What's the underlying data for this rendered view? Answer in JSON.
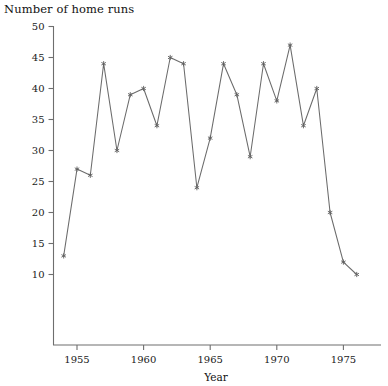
{
  "chart_data": {
    "type": "line",
    "title": "Number of home runs",
    "xlabel": "Year",
    "ylabel": "",
    "xlim": [
      1953.2,
      1976.8
    ],
    "ylim": [
      6.5,
      50
    ],
    "grid": false,
    "legend": "none",
    "marker": "asterisk",
    "line_color": "#6b6b6b",
    "marker_color": "#5f5f5f",
    "xticks": [
      1955,
      1960,
      1965,
      1970,
      1975
    ],
    "xtick_labels": [
      "1955",
      "1960",
      "1965",
      "1970",
      "1975"
    ],
    "yticks": [
      10,
      15,
      20,
      25,
      30,
      35,
      40,
      45,
      50
    ],
    "ytick_labels": [
      "10",
      "15",
      "20",
      "25",
      "30",
      "35",
      "40",
      "45",
      "50"
    ],
    "x": [
      1954,
      1955,
      1956,
      1957,
      1958,
      1959,
      1960,
      1961,
      1962,
      1963,
      1964,
      1965,
      1966,
      1967,
      1968,
      1969,
      1970,
      1971,
      1972,
      1973,
      1974,
      1975,
      1976
    ],
    "values": [
      13,
      27,
      26,
      44,
      30,
      39,
      40,
      34,
      45,
      44,
      24,
      32,
      44,
      39,
      29,
      44,
      38,
      47,
      34,
      40,
      20,
      12,
      10
    ],
    "series": [
      {
        "name": "Home runs",
        "values": [
          13,
          27,
          26,
          44,
          30,
          39,
          40,
          34,
          45,
          44,
          24,
          32,
          44,
          39,
          29,
          44,
          38,
          47,
          34,
          40,
          20,
          12,
          10
        ]
      }
    ]
  },
  "chart": {
    "title": "Number of home runs",
    "xaxis_label": "Year"
  }
}
